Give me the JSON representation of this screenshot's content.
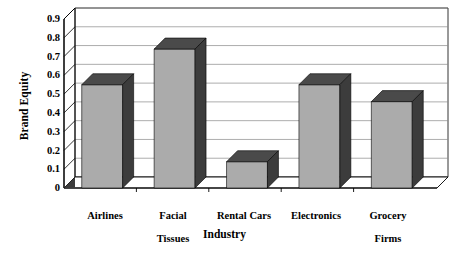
{
  "chart_data": {
    "type": "bar",
    "title": "",
    "xlabel": "Industry",
    "ylabel": "Brand Equity",
    "categories": [
      "Airlines",
      "Facial Tissues",
      "Rental Cars",
      "Electronics",
      "Grocery Firms"
    ],
    "values": [
      0.55,
      0.74,
      0.14,
      0.55,
      0.46
    ],
    "ylim": [
      0,
      0.9
    ],
    "ytick_labels": [
      "0",
      "0.1",
      "0.2",
      "0.3",
      "0.4",
      "0.5",
      "0.6",
      "0.7",
      "0.8",
      "0.9"
    ],
    "ytick_values": [
      0,
      0.1,
      0.2,
      0.3,
      0.4,
      0.5,
      0.6,
      0.7,
      0.8,
      0.9
    ],
    "grid": true,
    "legend": "none",
    "style": "3d",
    "series": [
      {
        "name": "Brand Equity",
        "values": [
          0.55,
          0.74,
          0.14,
          0.55,
          0.46
        ]
      }
    ],
    "colors": {
      "bar_front": "#ababab",
      "bar_side": "#3c3c3c",
      "bar_top": "#4a4a4a",
      "plot_background": "#ffffff",
      "grid_line": "#8a8a8a",
      "axis_line": "#000000",
      "text": "#000000"
    }
  },
  "axis": {
    "y_title": "Brand Equity",
    "x_title": "Industry"
  },
  "x_labels": [
    {
      "line1": "Airlines",
      "line2": ""
    },
    {
      "line1": "Facial",
      "line2": "Tissues"
    },
    {
      "line1": "Rental Cars",
      "line2": ""
    },
    {
      "line1": "Electronics",
      "line2": ""
    },
    {
      "line1": "Grocery",
      "line2": "Firms"
    }
  ]
}
